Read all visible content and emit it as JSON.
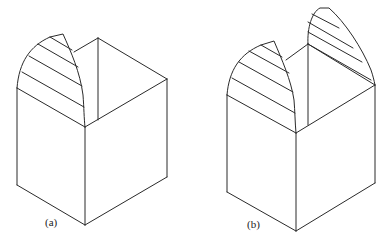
{
  "figures": [
    {
      "id": "a",
      "label": "(a)",
      "description": "Isometric cube with one quarter-round hatched cap on the front-left edge",
      "stroke_color": "#2a2a2a"
    },
    {
      "id": "b",
      "label": "(b)",
      "description": "Isometric cube with two hatched caps: one on the front-left edge and a taller one on the back-right edge",
      "stroke_color": "#2a2a2a"
    }
  ]
}
